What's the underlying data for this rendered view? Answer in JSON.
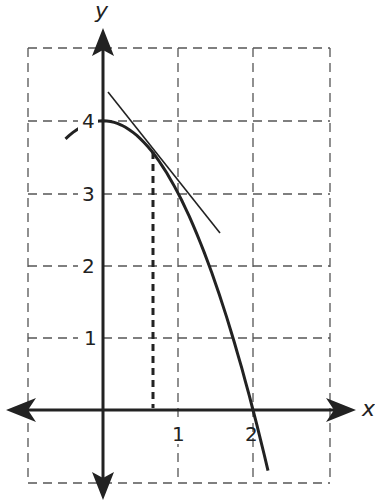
{
  "chart_data": {
    "type": "line",
    "title": "",
    "xlabel": "x",
    "ylabel": "y",
    "xlim": [
      -1,
      3
    ],
    "ylim": [
      -1,
      5
    ],
    "grid": true,
    "grid_style": "dashed",
    "x_ticks": [
      {
        "value": 1,
        "label": "1"
      },
      {
        "value": 2,
        "label": "2"
      }
    ],
    "y_ticks": [
      {
        "value": 1,
        "label": "1"
      },
      {
        "value": 2,
        "label": "2"
      },
      {
        "value": 3,
        "label": "3"
      },
      {
        "value": 4,
        "label": "4"
      }
    ],
    "series": [
      {
        "name": "curve",
        "equation": "y = 4 - x^2",
        "x": [
          -0.5,
          -0.25,
          0,
          0.25,
          0.5,
          0.75,
          1,
          1.25,
          1.5,
          1.75,
          2,
          2.2
        ],
        "y": [
          3.75,
          3.94,
          4,
          3.94,
          3.75,
          3.44,
          3,
          2.44,
          1.75,
          0.94,
          0,
          -0.84
        ]
      },
      {
        "name": "tangent line",
        "x": [
          0.07,
          1.56
        ],
        "y": [
          4.43,
          2.45
        ]
      }
    ],
    "annotations": [
      {
        "type": "dashed-vertical",
        "x": 0.67,
        "y_from": 0,
        "y_to": 3.56,
        "note": "point of tangency"
      }
    ]
  },
  "labels": {
    "x_axis": "x",
    "y_axis": "y",
    "xt1": "1",
    "xt2": "2",
    "yt1": "1",
    "yt2": "2",
    "yt3": "3",
    "yt4": "4"
  },
  "colors": {
    "ink": "#222222",
    "grid": "#555555",
    "background": "#ffffff"
  }
}
